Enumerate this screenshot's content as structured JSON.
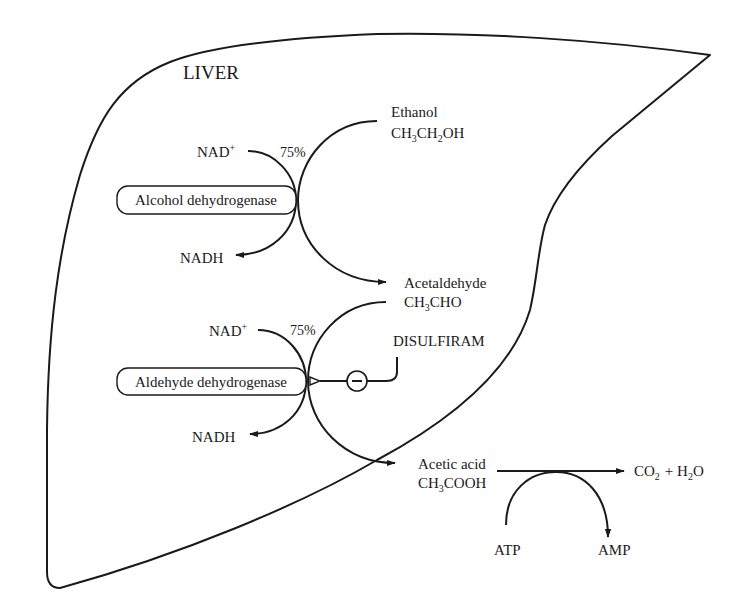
{
  "organ": {
    "label": "LIVER"
  },
  "colors": {
    "stroke": "#1a1a1a",
    "background": "#ffffff"
  },
  "reactions": [
    {
      "substrate": {
        "name": "Ethanol",
        "formula_parts": [
          "CH",
          "3",
          "CH",
          "2",
          "OH"
        ]
      },
      "enzyme": "Alcohol dehydrogenase",
      "cofactor_in": "NAD",
      "cofactor_in_charge": "+",
      "cofactor_out": "NADH",
      "percentage": "75%",
      "product": {
        "name": "Acetaldehyde",
        "formula_parts": [
          "CH",
          "3",
          "CHO"
        ]
      }
    },
    {
      "substrate": {
        "name": "Acetaldehyde",
        "formula_parts": [
          "CH",
          "3",
          "CHO"
        ]
      },
      "enzyme": "Aldehyde dehydrogenase",
      "cofactor_in": "NAD",
      "cofactor_in_charge": "+",
      "cofactor_out": "NADH",
      "percentage": "75%",
      "inhibitor": {
        "name": "DISULFIRAM",
        "symbol": "−"
      },
      "product": {
        "name": "Acetic acid",
        "formula_parts": [
          "CH",
          "3",
          "COOH"
        ]
      }
    },
    {
      "substrate": {
        "name": "Acetic acid"
      },
      "energy_in": "ATP",
      "energy_out": "AMP",
      "product": {
        "co2": "CO",
        "co2_sub": "2",
        "plus": "+ H",
        "h2o_sub": "2",
        "h2o_tail": "O"
      }
    }
  ]
}
